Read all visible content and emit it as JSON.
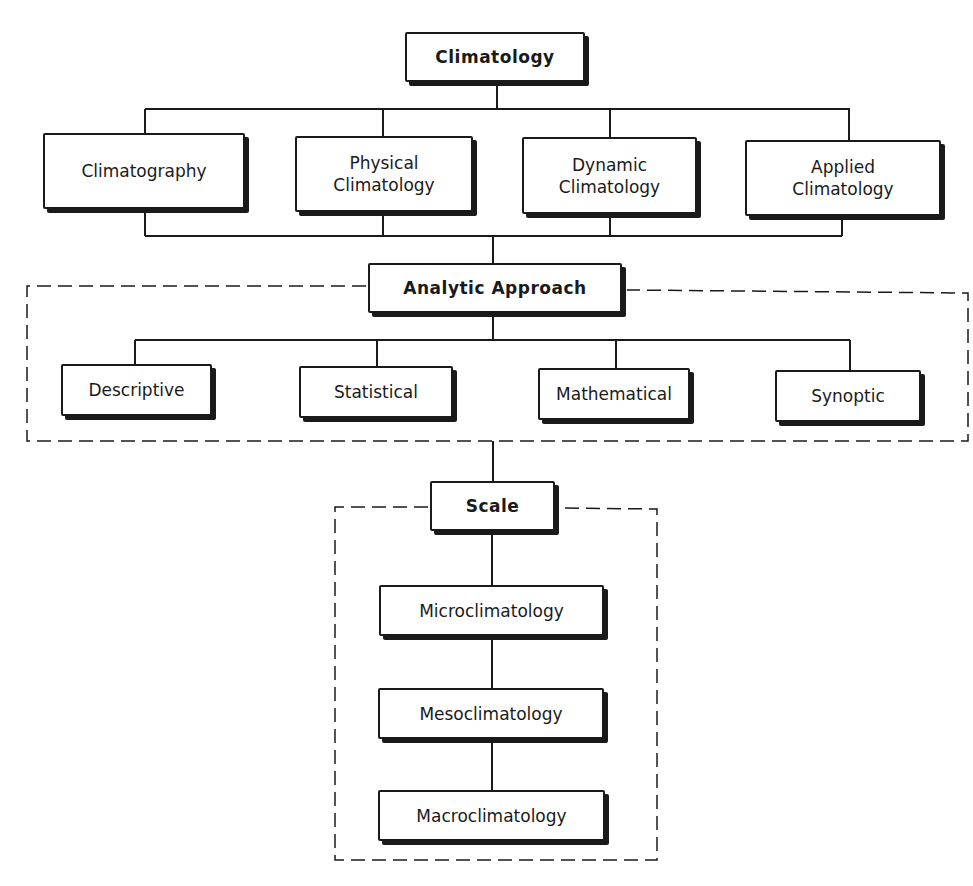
{
  "diagram": {
    "root": {
      "label": "Climatology"
    },
    "branches": [
      {
        "label": "Climatography"
      },
      {
        "label": "Physical\nClimatology"
      },
      {
        "label": "Dynamic\nClimatology"
      },
      {
        "label": "Applied\nClimatology"
      }
    ],
    "analytic": {
      "label": "Analytic Approach",
      "items": [
        {
          "label": "Descriptive"
        },
        {
          "label": "Statistical"
        },
        {
          "label": "Mathematical"
        },
        {
          "label": "Synoptic"
        }
      ]
    },
    "scale": {
      "label": "Scale",
      "items": [
        {
          "label": "Microclimatology"
        },
        {
          "label": "Mesoclimatology"
        },
        {
          "label": "Macroclimatology"
        }
      ]
    }
  },
  "colors": {
    "ink": "#1a1a1a",
    "background": "#ffffff"
  }
}
